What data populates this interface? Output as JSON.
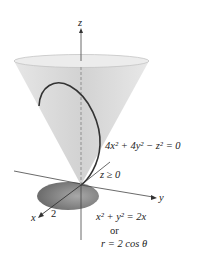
{
  "diagram": {
    "axes": {
      "z_label": "z",
      "y_label": "y",
      "x_label": "x"
    },
    "labels": {
      "cone_equation": "4x² + 4y² − z² = 0",
      "constraint": "z ≥ 0",
      "x_tick": "2",
      "cylinder_equation": "x² + y² = 2x",
      "or": "or",
      "polar_equation": "r = 2 cos θ"
    },
    "colors": {
      "cone_fill": "#dcdcdc",
      "disk_fill": "#8a8a8a",
      "curve": "#333333",
      "axes": "#444444"
    }
  }
}
